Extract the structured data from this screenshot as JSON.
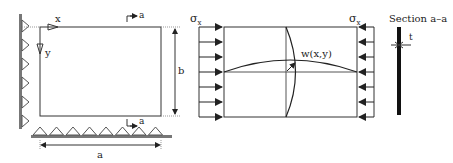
{
  "diagram": {
    "plate_view": {
      "axis_x_label": "x",
      "axis_y_label": "y",
      "width_label": "a",
      "height_label": "b",
      "section_mark_label": "a",
      "support_count_left": 6,
      "support_count_bottom": 8
    },
    "loaded_view": {
      "stress_label_left": "σ",
      "stress_label_right": "σ",
      "stress_subscript": "x",
      "deflection_label": "w(x,y)",
      "arrow_count_per_side": 7
    },
    "section_view": {
      "title": "Section a–a",
      "thickness_label": "t"
    },
    "colors": {
      "line": "#333333",
      "support_fill": "#888888"
    }
  }
}
